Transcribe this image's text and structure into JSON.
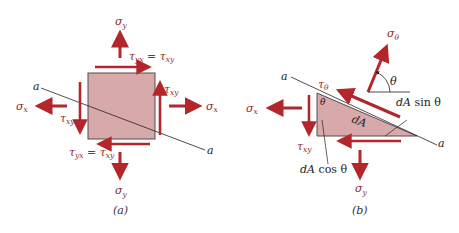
{
  "figure": {
    "panels": [
      {
        "id": "a",
        "caption": "(a)",
        "labels": {
          "sigma_y_top": "σ",
          "sigma_y_top_sub": "y",
          "tau_top": "τ",
          "tau_top_sub1": "yx",
          "tau_top_eq": " = τ",
          "tau_top_sub2": "xy",
          "tau_right": "τ",
          "tau_right_sub": "xy",
          "sigma_x_right": "σ",
          "sigma_x_right_sub": "x",
          "sigma_x_left": "σ",
          "sigma_x_left_sub": "x",
          "tau_left": "τ",
          "tau_left_sub": "xy",
          "tau_bottom": "τ",
          "tau_bottom_sub1": "yx",
          "tau_bottom_eq": " = τ",
          "tau_bottom_sub2": "xy",
          "sigma_y_bottom": "σ",
          "sigma_y_bottom_sub": "y",
          "plane_label_1": "a",
          "plane_label_2": "a"
        }
      },
      {
        "id": "b",
        "caption": "(b)",
        "labels": {
          "sigma_theta": "σ",
          "sigma_theta_sub": "θ",
          "theta_angle": "θ",
          "tau_theta": "τ",
          "tau_theta_sub": "θ",
          "theta_corner": "θ",
          "dA_sin": "dA",
          "dA_sin_fn": " sin θ",
          "dA": "dA",
          "sigma_x": "σ",
          "sigma_x_sub": "x",
          "tau_xy": "τ",
          "tau_xy_sub": "xy",
          "dA_cos": "dA",
          "dA_cos_fn": " cos θ",
          "sigma_y": "σ",
          "sigma_y_sub": "y",
          "plane_label_1": "a",
          "plane_label_2": "a"
        }
      }
    ],
    "colors": {
      "arrow": "#b3262b",
      "element_fill": "#d8a9ab",
      "element_stroke": "#5a4a4a",
      "label": "#8c2a2e",
      "line": "#222222"
    }
  }
}
